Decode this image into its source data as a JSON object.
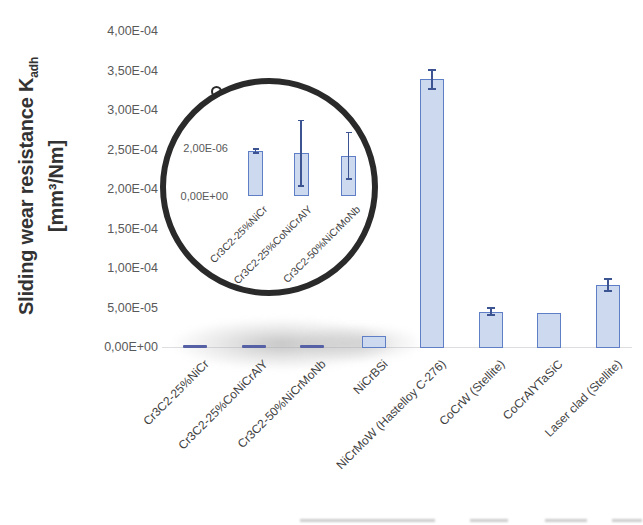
{
  "y_axis": {
    "title_main": "Sliding wear resistance K",
    "title_sub": "adh",
    "title_units": "[mm³/Nm]",
    "tick_labels": [
      "0,00E+00",
      "5,00E-05",
      "1,00E-04",
      "1,50E-04",
      "2,00E-04",
      "2,50E-04",
      "3,00E-04",
      "3,50E-04",
      "4,00E-04"
    ]
  },
  "chart_data": {
    "type": "bar",
    "title": "",
    "xlabel": "",
    "ylabel": "Sliding wear resistance Kadh [mm³/Nm]",
    "grid": false,
    "legend": false,
    "ylim": [
      0,
      0.0004
    ],
    "ytick_step": 5e-05,
    "categories": [
      "Cr3C2-25%NiCr",
      "Cr3C2-25%CoNiCrAlY",
      "Cr3C2-50%NiCrMoNb",
      "NiCrBSi",
      "NiCrMoW (Hastelloy C-276)",
      "CoCrW (Stellite)",
      "CoCrAlYTaSiC",
      "Laser clad (Stellite)"
    ],
    "values": [
      1.9e-06,
      1.8e-06,
      1.7e-06,
      1.5e-05,
      0.00034,
      4.6e-05,
      4.4e-05,
      8e-05
    ],
    "errors": [
      1.2e-07,
      1.4e-06,
      1e-06,
      0,
      1.3e-05,
      6e-06,
      0,
      9e-06
    ],
    "inset": {
      "type": "bar",
      "description": "magnified circular inset of first three bars",
      "ylim": [
        0,
        2.6e-06
      ],
      "ytick_labels": [
        "0,00E+00",
        "2,00E-06"
      ],
      "ytick_values": [
        0,
        2e-06
      ],
      "categories": [
        "Cr3C2-25%NiCr",
        "Cr3C2-25%CoNiCrAlY",
        "Cr3C2-50%NiCrMoNb"
      ],
      "values": [
        1.9e-06,
        1.8e-06,
        1.7e-06
      ],
      "errors": [
        1.2e-07,
        1.4e-06,
        1e-06
      ]
    }
  },
  "colors": {
    "bar_fill": "#cdd9ee",
    "bar_border": "#5e7ec6",
    "tiny_bar": "#5661a5",
    "error_bar": "#3d5493",
    "tick_text": "#595959",
    "label_text": "#3f3f3f",
    "axis_title_text": "#333333",
    "inset_circle": "#2a2a2a"
  }
}
